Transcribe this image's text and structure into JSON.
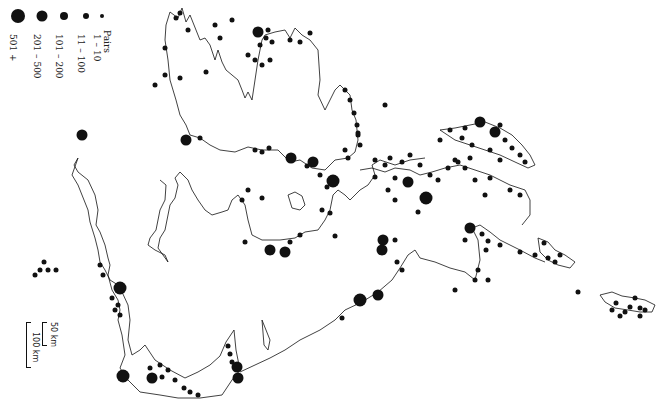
{
  "legend": {
    "title": "Pairs",
    "entries": [
      {
        "label": "1 – 10",
        "size": 4
      },
      {
        "label": "11 – 100",
        "size": 6
      },
      {
        "label": "101 – 200",
        "size": 8
      },
      {
        "label": "201 – 500",
        "size": 11
      },
      {
        "label": "501 +",
        "size": 14
      }
    ]
  },
  "scale": {
    "small_label": "50 km",
    "large_label": "100 km"
  },
  "colors": {
    "coastline": "#111111",
    "symbol": "#111111",
    "background": "#ffffff"
  },
  "map": {
    "symbols": [
      [
        82,
        135,
        11
      ],
      [
        44,
        262,
        5
      ],
      [
        40,
        270,
        5
      ],
      [
        48,
        270,
        5
      ],
      [
        56,
        270,
        5
      ],
      [
        35,
        275,
        5
      ],
      [
        100,
        265,
        5
      ],
      [
        103,
        275,
        5
      ],
      [
        120,
        288,
        13
      ],
      [
        112,
        298,
        5
      ],
      [
        118,
        305,
        5
      ],
      [
        115,
        310,
        5
      ],
      [
        120,
        315,
        5
      ],
      [
        123,
        376,
        13
      ],
      [
        152,
        378,
        11
      ],
      [
        162,
        377,
        5
      ],
      [
        150,
        368,
        5
      ],
      [
        160,
        365,
        5
      ],
      [
        168,
        370,
        5
      ],
      [
        175,
        380,
        5
      ],
      [
        184,
        388,
        5
      ],
      [
        190,
        392,
        5
      ],
      [
        198,
        395,
        5
      ],
      [
        232,
        362,
        5
      ],
      [
        230,
        354,
        5
      ],
      [
        228,
        346,
        5
      ],
      [
        237,
        367,
        11
      ],
      [
        238,
        378,
        11
      ],
      [
        186,
        140,
        11
      ],
      [
        200,
        138,
        5
      ],
      [
        255,
        150,
        5
      ],
      [
        262,
        152,
        5
      ],
      [
        269,
        148,
        5
      ],
      [
        291,
        158,
        11
      ],
      [
        313,
        162,
        11
      ],
      [
        320,
        175,
        5
      ],
      [
        307,
        166,
        5
      ],
      [
        333,
        181,
        13
      ],
      [
        327,
        187,
        5
      ],
      [
        348,
        158,
        5
      ],
      [
        345,
        150,
        5
      ],
      [
        258,
        32,
        11
      ],
      [
        266,
        38,
        5
      ],
      [
        272,
        42,
        5
      ],
      [
        268,
        30,
        5
      ],
      [
        260,
        45,
        5
      ],
      [
        270,
        60,
        5
      ],
      [
        255,
        60,
        5
      ],
      [
        262,
        65,
        5
      ],
      [
        290,
        40,
        5
      ],
      [
        232,
        20,
        5
      ],
      [
        215,
        25,
        5
      ],
      [
        220,
        38,
        5
      ],
      [
        180,
        13,
        5
      ],
      [
        176,
        18,
        5
      ],
      [
        165,
        48,
        5
      ],
      [
        165,
        75,
        5
      ],
      [
        188,
        30,
        5
      ],
      [
        206,
        72,
        5
      ],
      [
        180,
        78,
        5
      ],
      [
        155,
        85,
        5
      ],
      [
        248,
        55,
        5
      ],
      [
        300,
        42,
        5
      ],
      [
        310,
        33,
        5
      ],
      [
        345,
        90,
        5
      ],
      [
        350,
        100,
        5
      ],
      [
        354,
        113,
        5
      ],
      [
        357,
        125,
        5
      ],
      [
        358,
        135,
        5
      ],
      [
        360,
        145,
        5
      ],
      [
        270,
        250,
        11
      ],
      [
        285,
        252,
        11
      ],
      [
        245,
        242,
        5
      ],
      [
        290,
        242,
        5
      ],
      [
        300,
        235,
        5
      ],
      [
        262,
        198,
        5
      ],
      [
        242,
        200,
        5
      ],
      [
        248,
        190,
        5
      ],
      [
        330,
        213,
        5
      ],
      [
        335,
        236,
        5
      ],
      [
        322,
        210,
        5
      ],
      [
        360,
        300,
        13
      ],
      [
        378,
        295,
        11
      ],
      [
        383,
        240,
        11
      ],
      [
        382,
        250,
        11
      ],
      [
        397,
        262,
        5
      ],
      [
        402,
        270,
        5
      ],
      [
        395,
        240,
        5
      ],
      [
        342,
        318,
        5
      ],
      [
        470,
        228,
        11
      ],
      [
        482,
        234,
        5
      ],
      [
        465,
        240,
        5
      ],
      [
        488,
        241,
        5
      ],
      [
        478,
        270,
        5
      ],
      [
        475,
        280,
        5
      ],
      [
        488,
        280,
        5
      ],
      [
        455,
        290,
        5
      ],
      [
        486,
        250,
        5
      ],
      [
        500,
        245,
        5
      ],
      [
        520,
        252,
        5
      ],
      [
        535,
        255,
        5
      ],
      [
        544,
        243,
        5
      ],
      [
        548,
        258,
        5
      ],
      [
        555,
        262,
        5
      ],
      [
        560,
        255,
        5
      ],
      [
        578,
        292,
        5
      ],
      [
        616,
        303,
        5
      ],
      [
        630,
        307,
        5
      ],
      [
        640,
        308,
        5
      ],
      [
        625,
        312,
        5
      ],
      [
        635,
        298,
        5
      ],
      [
        645,
        310,
        5
      ],
      [
        620,
        316,
        5
      ],
      [
        640,
        316,
        5
      ],
      [
        612,
        310,
        5
      ],
      [
        426,
        198,
        13
      ],
      [
        408,
        182,
        11
      ],
      [
        395,
        178,
        5
      ],
      [
        385,
        165,
        5
      ],
      [
        375,
        160,
        5
      ],
      [
        390,
        158,
        5
      ],
      [
        402,
        162,
        5
      ],
      [
        410,
        155,
        5
      ],
      [
        420,
        165,
        5
      ],
      [
        430,
        175,
        5
      ],
      [
        438,
        180,
        5
      ],
      [
        448,
        168,
        5
      ],
      [
        458,
        162,
        5
      ],
      [
        465,
        168,
        5
      ],
      [
        475,
        180,
        5
      ],
      [
        490,
        178,
        5
      ],
      [
        375,
        177,
        5
      ],
      [
        388,
        190,
        5
      ],
      [
        395,
        200,
        5
      ],
      [
        418,
        212,
        5
      ],
      [
        455,
        160,
        5
      ],
      [
        470,
        158,
        5
      ],
      [
        440,
        140,
        5
      ],
      [
        450,
        130,
        5
      ],
      [
        465,
        128,
        5
      ],
      [
        480,
        122,
        11
      ],
      [
        495,
        132,
        11
      ],
      [
        505,
        140,
        5
      ],
      [
        512,
        148,
        5
      ],
      [
        520,
        155,
        5
      ],
      [
        525,
        162,
        5
      ],
      [
        500,
        125,
        5
      ],
      [
        462,
        138,
        5
      ],
      [
        472,
        145,
        5
      ],
      [
        490,
        150,
        5
      ],
      [
        500,
        160,
        5
      ],
      [
        385,
        105,
        5
      ],
      [
        358,
        133,
        5
      ],
      [
        485,
        195,
        5
      ],
      [
        510,
        190,
        5
      ],
      [
        520,
        195,
        5
      ]
    ]
  }
}
